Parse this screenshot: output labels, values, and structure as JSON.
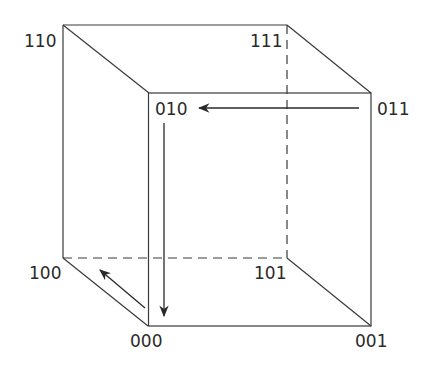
{
  "diagram": {
    "type": "binary-cube",
    "vertices": [
      {
        "id": "110",
        "label": "110"
      },
      {
        "id": "111",
        "label": "111"
      },
      {
        "id": "010",
        "label": "010"
      },
      {
        "id": "011",
        "label": "011"
      },
      {
        "id": "100",
        "label": "100"
      },
      {
        "id": "101",
        "label": "101"
      },
      {
        "id": "000",
        "label": "000"
      },
      {
        "id": "001",
        "label": "001"
      }
    ],
    "hidden_edges": [
      "111-101",
      "100-101"
    ],
    "arrows": [
      {
        "from": "011",
        "to": "010"
      },
      {
        "from": "010",
        "to": "000"
      },
      {
        "from": "000",
        "to": "100"
      }
    ],
    "colors": {
      "line": "#3a3a3a",
      "text": "#2a2a2a",
      "background": "#ffffff"
    }
  }
}
